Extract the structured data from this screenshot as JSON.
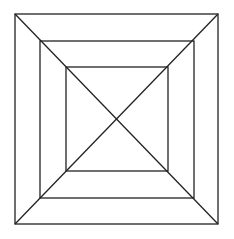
{
  "diagram": {
    "type": "nested-squares-with-diagonals",
    "canvas": {
      "width": 234,
      "height": 239,
      "background": "#ffffff"
    },
    "stroke": {
      "color": "#222222",
      "width": 1.3
    },
    "squares": [
      {
        "name": "outer",
        "x1": 15,
        "y1": 14,
        "x2": 218,
        "y2": 224
      },
      {
        "name": "middle",
        "x1": 40,
        "y1": 41,
        "x2": 194,
        "y2": 198
      },
      {
        "name": "inner",
        "x1": 66,
        "y1": 67,
        "x2": 168,
        "y2": 171
      }
    ],
    "diagonals": [
      {
        "name": "diagonal-tl-br",
        "x1": 15,
        "y1": 14,
        "x2": 218,
        "y2": 224
      },
      {
        "name": "diagonal-tr-bl",
        "x1": 218,
        "y1": 14,
        "x2": 15,
        "y2": 224
      }
    ]
  }
}
